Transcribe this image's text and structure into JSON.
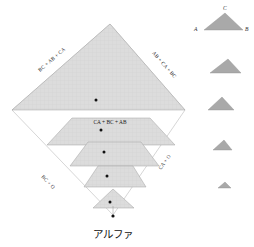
{
  "figure": {
    "title_text": "アルファ",
    "colors": {
      "layer_fill": "#d9d9d9",
      "layer_stroke": "#9a9a9a",
      "hatch_line": "#c4c4c4",
      "legend_fill": "#a9a9a9",
      "legend_stroke": "#8f8f8f",
      "outline_stroke": "#b0b0b0",
      "dot_color": "#111111",
      "text_color": "#1a1a1a",
      "background": "#ffffff"
    }
  },
  "pyramid": {
    "edge_labels": {
      "upper_left": "BC + AB + CA",
      "upper_right": "AB + CA + BC",
      "lower_left": "BC + O",
      "lower_right": "CA + O"
    },
    "center_label": "CA + BC + AB",
    "layers": [
      {
        "index": 1,
        "name": "layer-1-apex-triangle"
      },
      {
        "index": 2,
        "name": "layer-2-trapezoid"
      },
      {
        "index": 3,
        "name": "layer-3-trapezoid"
      },
      {
        "index": 4,
        "name": "layer-4-trapezoid"
      },
      {
        "index": 5,
        "name": "layer-5-small-triangle"
      }
    ],
    "apex_marker": "bottom-vertex-dot"
  },
  "legend": {
    "vertex_labels": {
      "left": "A",
      "right": "B",
      "apex": "C"
    },
    "items": [
      {
        "index": 1,
        "name": "legend-triangle-1"
      },
      {
        "index": 2,
        "name": "legend-triangle-2"
      },
      {
        "index": 3,
        "name": "legend-triangle-3"
      },
      {
        "index": 4,
        "name": "legend-triangle-4"
      },
      {
        "index": 5,
        "name": "legend-triangle-5"
      }
    ]
  }
}
